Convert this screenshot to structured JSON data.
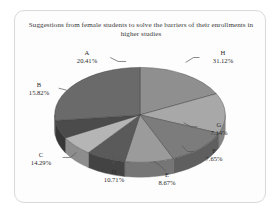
{
  "chart_data": {
    "type": "pie",
    "title": "Suggestions from female students to solve the barriers of their enrollments in higher studies",
    "xlabel": "",
    "ylabel": "",
    "legend_position": "none",
    "grid": false,
    "three_d": true,
    "labels_show_percent": true,
    "categories": [
      "A",
      "B",
      "C",
      "D",
      "E",
      "F",
      "G",
      "H"
    ],
    "values": [
      20.41,
      15.82,
      14.29,
      10.71,
      8.67,
      7.65,
      7.14,
      31.12
    ],
    "slices": [
      {
        "key": "A",
        "percent": "20.41%",
        "value": 20.41,
        "color": "#8f8f8f",
        "side_color": "#6f6f6f"
      },
      {
        "key": "B",
        "percent": "15.82%",
        "value": 15.82,
        "color": "#a8a8a8",
        "side_color": "#848484"
      },
      {
        "key": "C",
        "percent": "14.29%",
        "value": 14.29,
        "color": "#7c7c7c",
        "side_color": "#5f5f5f"
      },
      {
        "key": "D",
        "percent": "10.71%",
        "value": 10.71,
        "color": "#9b9b9b",
        "side_color": "#767676"
      },
      {
        "key": "E",
        "percent": "8.67%",
        "value": 8.67,
        "color": "#5a5a5a",
        "side_color": "#434343"
      },
      {
        "key": "F",
        "percent": "7.65%",
        "value": 7.65,
        "color": "#b5b5b5",
        "side_color": "#8d8d8d"
      },
      {
        "key": "G",
        "percent": "7.14%",
        "value": 7.14,
        "color": "#4b4b4b",
        "side_color": "#373737"
      },
      {
        "key": "H",
        "percent": "31.12%",
        "value": 31.12,
        "color": "#6a6a6a",
        "side_color": "#505050"
      }
    ]
  },
  "chart": {
    "title_line1": "Suggestions from female students to solve the barriers of",
    "title_line2": "their enrollments in higher studies"
  },
  "labels": {
    "A": {
      "key": "A",
      "percent": "20.41%"
    },
    "B": {
      "key": "B",
      "percent": "15.82%"
    },
    "C": {
      "key": "C",
      "percent": "14.29%"
    },
    "D": {
      "key": "D",
      "percent": "10.71%"
    },
    "E": {
      "key": "E",
      "percent": "8.67%"
    },
    "F": {
      "key": "F",
      "percent": "7.65%"
    },
    "G": {
      "key": "G",
      "percent": "7.14%"
    },
    "H": {
      "key": "H",
      "percent": "31.12%"
    }
  },
  "colors": {
    "frame_border": "#d9d9d9",
    "background": "#ffffff",
    "title_text": "#3a3a3a",
    "label_text": "#2b2b2b",
    "leader_line": "#555555"
  }
}
